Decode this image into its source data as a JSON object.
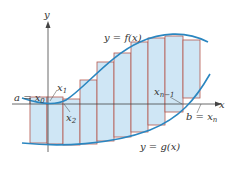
{
  "figure": {
    "axis_x_label": "x",
    "axis_y_label": "y",
    "curve_f_label": "y = f(x)",
    "curve_g_label": "y = g(x)",
    "label_a": "a = x",
    "label_a_sub": "0",
    "label_x1": "x",
    "label_x1_sub": "1",
    "label_x2": "x",
    "label_x2_sub": "2",
    "label_xn1": "x",
    "label_xn1_sub": "n−1",
    "label_b": "b = x",
    "label_b_sub": "n"
  },
  "colors": {
    "curve": "#2a86c0",
    "rect_fill": "#cfe6f5",
    "rect_stroke": "#b5584e",
    "axis": "#444444"
  },
  "rectangles": [
    {
      "x0": 30,
      "x1": 47,
      "top": 97,
      "bottom": 143
    },
    {
      "x0": 47,
      "x1": 63,
      "top": 97,
      "bottom": 144
    },
    {
      "x0": 63,
      "x1": 80,
      "top": 99,
      "bottom": 145
    },
    {
      "x0": 80,
      "x1": 97,
      "top": 80,
      "bottom": 144
    },
    {
      "x0": 97,
      "x1": 114,
      "top": 62,
      "bottom": 141
    },
    {
      "x0": 114,
      "x1": 131,
      "top": 53,
      "bottom": 137
    },
    {
      "x0": 131,
      "x1": 148,
      "top": 42,
      "bottom": 132
    },
    {
      "x0": 148,
      "x1": 165,
      "top": 38,
      "bottom": 125
    },
    {
      "x0": 165,
      "x1": 183,
      "top": 36,
      "bottom": 112
    },
    {
      "x0": 183,
      "x1": 200,
      "top": 40,
      "bottom": 98
    }
  ]
}
